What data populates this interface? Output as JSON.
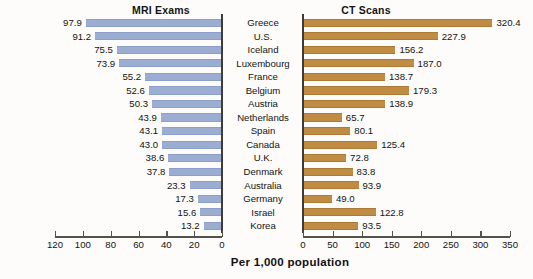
{
  "chart_data": {
    "type": "bar",
    "title": "",
    "subtitle": "",
    "xlabel": "Per 1,000 population",
    "ylabel": "",
    "orientation": "horizontal",
    "layout": "bidirectional-pyramid",
    "grid": false,
    "legend_position": "none",
    "panels": [
      {
        "name": "mri",
        "title": "MRI Exams",
        "direction": "left",
        "color": "#9cadd2",
        "xlim": [
          0,
          120
        ],
        "ticks": [
          120,
          100,
          80,
          60,
          40,
          20,
          0
        ],
        "tick_labels": [
          "120",
          "100",
          "80",
          "60",
          "40",
          "20",
          "0"
        ],
        "values": [
          97.9,
          91.2,
          75.5,
          73.9,
          55.2,
          52.6,
          50.3,
          43.9,
          43.1,
          43.0,
          38.6,
          37.8,
          23.3,
          17.3,
          15.6,
          13.2
        ],
        "value_labels": [
          "97.9",
          "91.2",
          "75.5",
          "73.9",
          "55.2",
          "52.6",
          "50.3",
          "43.9",
          "43.1",
          "43.0",
          "38.6",
          "37.8",
          "23.3",
          "17.3",
          "15.6",
          "13.2"
        ]
      },
      {
        "name": "ct",
        "title": "CT Scans",
        "direction": "right",
        "color": "#c08c43",
        "xlim": [
          0,
          350
        ],
        "ticks": [
          0,
          50,
          100,
          150,
          200,
          250,
          300,
          350
        ],
        "tick_labels": [
          "0",
          "50",
          "100",
          "150",
          "200",
          "250",
          "300",
          "350"
        ],
        "values": [
          320.4,
          227.9,
          156.2,
          187.0,
          138.7,
          179.3,
          138.9,
          65.7,
          80.1,
          125.4,
          72.8,
          83.8,
          93.9,
          49.0,
          122.8,
          93.5
        ],
        "value_labels": [
          "320.4",
          "227.9",
          "156.2",
          "187.0",
          "138.7",
          "179.3",
          "138.9",
          "65.7",
          "80.1",
          "125.4",
          "72.8",
          "83.8",
          "93.9",
          "49.0",
          "122.8",
          "93.5"
        ]
      }
    ],
    "categories": [
      "Greece",
      "U.S.",
      "Iceland",
      "Luxembourg",
      "France",
      "Belgium",
      "Austria",
      "Netherlands",
      "Spain",
      "Canada",
      "U.K.",
      "Denmark",
      "Australia",
      "Germany",
      "Israel",
      "Korea"
    ]
  },
  "colors": {
    "mri_bar": "#9cadd2",
    "ct_bar": "#c08c43",
    "axis": "#55524a",
    "zero_line": "#3c3c3c",
    "text": "#131313",
    "background": "#fdfcfa"
  }
}
